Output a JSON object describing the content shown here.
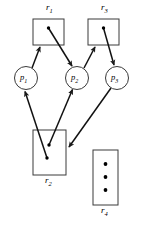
{
  "diagram": {
    "type": "resource-allocation-graph",
    "background_color": "#ffffff",
    "stroke_color": "#1a1a1a",
    "resources": [
      {
        "id": "r1",
        "label": "r",
        "subscript": "1",
        "shape": "rectangle",
        "x": 33,
        "y": 19,
        "width": 31,
        "height": 26,
        "label_x": 46,
        "label_y": 5,
        "label_position": "above",
        "instances": 1,
        "dots": [
          {
            "x": 48.5,
            "y": 28
          }
        ]
      },
      {
        "id": "r3",
        "label": "r",
        "subscript": "3",
        "shape": "rectangle",
        "x": 88,
        "y": 19,
        "width": 31,
        "height": 26,
        "label_x": 101,
        "label_y": 5,
        "label_position": "above",
        "instances": 1,
        "dots": [
          {
            "x": 103.5,
            "y": 28
          }
        ]
      },
      {
        "id": "r2",
        "label": "r",
        "subscript": "2",
        "shape": "rectangle",
        "x": 33,
        "y": 130,
        "width": 33,
        "height": 45,
        "label_x": 45,
        "label_y": 177,
        "label_position": "below",
        "instances": 2,
        "dots": [
          {
            "x": 49,
            "y": 145
          },
          {
            "x": 47,
            "y": 158
          }
        ]
      },
      {
        "id": "r4",
        "label": "r",
        "subscript": "4",
        "shape": "rectangle",
        "x": 93,
        "y": 150,
        "width": 25,
        "height": 55,
        "label_x": 102,
        "label_y": 207,
        "label_position": "below",
        "instances": 3,
        "dots": [
          {
            "x": 105.5,
            "y": 164
          },
          {
            "x": 105.5,
            "y": 177
          },
          {
            "x": 105.5,
            "y": 190
          }
        ]
      }
    ],
    "processes": [
      {
        "id": "p1",
        "label": "p",
        "subscript": "1",
        "shape": "circle",
        "cx": 26,
        "cy": 78,
        "r": 11.5
      },
      {
        "id": "p2",
        "label": "p",
        "subscript": "2",
        "shape": "circle",
        "cx": 77,
        "cy": 78,
        "r": 11.5
      },
      {
        "id": "p3",
        "label": "p",
        "subscript": "3",
        "shape": "circle",
        "cx": 117,
        "cy": 78,
        "r": 11.5
      }
    ],
    "edges": [
      {
        "id": "e1",
        "from": "p1",
        "to": "r1",
        "kind": "request",
        "x1": 32,
        "y1": 68,
        "x2": 40,
        "y2": 47
      },
      {
        "id": "e2",
        "from": "r1",
        "to": "p2",
        "kind": "assignment",
        "x1": 48.5,
        "y1": 28,
        "x2": 72,
        "y2": 66
      },
      {
        "id": "e3",
        "from": "p2",
        "to": "r3",
        "kind": "request",
        "x1": 84,
        "y1": 68,
        "x2": 95,
        "y2": 47
      },
      {
        "id": "e4",
        "from": "r3",
        "to": "p3",
        "kind": "assignment",
        "x1": 103.5,
        "y1": 28,
        "x2": 114,
        "y2": 65
      },
      {
        "id": "e5",
        "from": "r2",
        "to": "p1",
        "kind": "assignment",
        "x1": 47,
        "y1": 158,
        "x2": 25,
        "y2": 91
      },
      {
        "id": "e6",
        "from": "r2",
        "to": "p2",
        "kind": "assignment",
        "x1": 49,
        "y1": 145,
        "x2": 72,
        "y2": 90
      },
      {
        "id": "e7",
        "from": "p3",
        "to": "r2",
        "kind": "request",
        "x1": 112,
        "y1": 88,
        "x2": 68,
        "y2": 147
      }
    ]
  }
}
